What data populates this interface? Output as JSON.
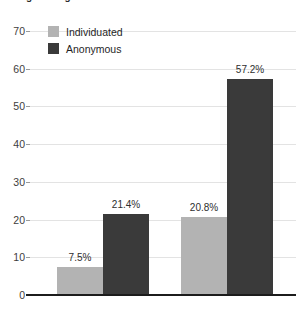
{
  "chart_data": {
    "type": "bar",
    "title": "Using Testing",
    "categories": [
      "Alone",
      "In groups"
    ],
    "series": [
      {
        "name": "Individuated",
        "color": "#b3b3b3",
        "values": [
          7.5,
          20.8
        ],
        "labels": [
          "7.5%",
          "20.8%"
        ]
      },
      {
        "name": "Anonymous",
        "color": "#3a3a3a",
        "values": [
          21.4,
          57.2
        ],
        "labels": [
          "21.4%",
          "57.2%"
        ]
      }
    ],
    "xlabel": "",
    "ylabel": "",
    "ylim": [
      0,
      70
    ],
    "yticks": [
      0,
      10,
      20,
      30,
      40,
      50,
      60,
      70
    ],
    "ytick_labels": [
      "0",
      "10",
      "20",
      "30",
      "40",
      "50",
      "60",
      "70"
    ],
    "grid": true,
    "legend_position": "top-left"
  },
  "colors": {
    "individuated": "#b3b3b3",
    "anonymous": "#3a3a3a",
    "gridline": "#e3e3e3",
    "axis": "#1c1c1c",
    "background": "#ffffff"
  }
}
